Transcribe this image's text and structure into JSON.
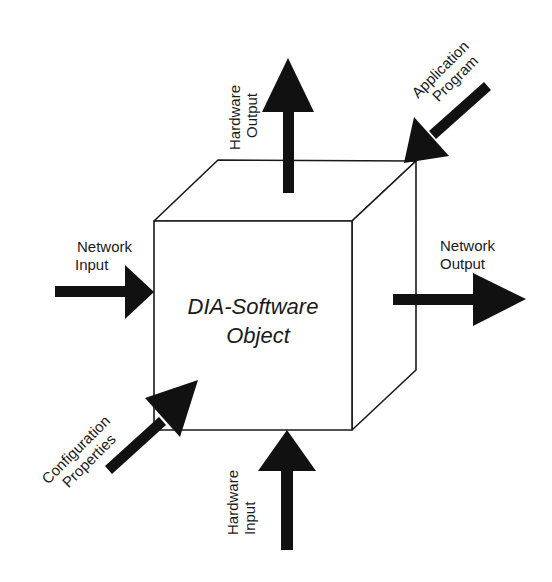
{
  "diagram": {
    "title": "DIA-Software Object",
    "center_label": {
      "line1": "DIA-Software",
      "line2": "Object"
    },
    "colors": {
      "stroke": "#1a1a1a",
      "arrow": "#111111",
      "background": "#ffffff"
    },
    "arrows": [
      {
        "id": "hardware-output",
        "direction": "out",
        "label": {
          "line1": "Hardware",
          "line2": "Output"
        }
      },
      {
        "id": "application-program",
        "direction": "in",
        "label": {
          "line1": "Application",
          "line2": "Program"
        }
      },
      {
        "id": "network-input",
        "direction": "in",
        "label": {
          "line1": "Network",
          "line2": "Input"
        }
      },
      {
        "id": "network-output",
        "direction": "out",
        "label": {
          "line1": "Network",
          "line2": "Output"
        }
      },
      {
        "id": "configuration-properties",
        "direction": "in",
        "label": {
          "line1": "Configuration",
          "line2": "Properties"
        }
      },
      {
        "id": "hardware-input",
        "direction": "in",
        "label": {
          "line1": "Hardware",
          "line2": "Input"
        }
      }
    ]
  }
}
